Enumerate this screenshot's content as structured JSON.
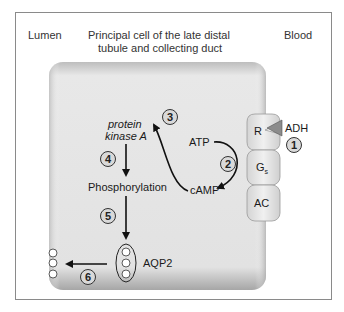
{
  "labels": {
    "lumen": "Lumen",
    "cell_title_line1": "Principal cell of the late distal",
    "cell_title_line2": "tubule and collecting duct",
    "blood": "Blood"
  },
  "membrane_proteins": {
    "receptor": "R",
    "g_protein": "G",
    "g_protein_subscript": "s",
    "adenylyl_cyclase": "AC",
    "hormone": "ADH"
  },
  "molecules": {
    "atp": "ATP",
    "camp": "cAMP",
    "pka_line1": "protein",
    "pka_line2": "kinase A",
    "phosphorylation": "Phosphorylation",
    "aqp2": "AQP2"
  },
  "steps": [
    "1",
    "2",
    "3",
    "4",
    "5",
    "6"
  ],
  "colors": {
    "cell_fill": "#dcdcdc",
    "cell_edge": "#a8a8a8",
    "protein_fill": "#e6e6e6",
    "ligand": "#8c8c8c",
    "step_circle": "#d9d9d9",
    "arrow": "#111111"
  }
}
